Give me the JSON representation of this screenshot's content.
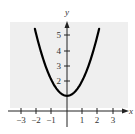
{
  "chart_data": {
    "type": "line",
    "title": "",
    "function": "y = x^2 + 1",
    "xlabel": "x",
    "ylabel": "y",
    "xlim": [
      -3,
      3
    ],
    "ylim": [
      0,
      5
    ],
    "grid": false,
    "background_color": "#efefef",
    "x_ticks": [
      -3,
      -2,
      -1,
      1,
      2,
      3
    ],
    "x_tick_labels": [
      "−3",
      "−2",
      "−1",
      "1",
      "2",
      "3"
    ],
    "y_ticks": [
      2,
      3,
      4,
      5
    ],
    "y_tick_labels": [
      "2",
      "3",
      "4",
      "5"
    ],
    "series": [
      {
        "name": "parabola",
        "x": [
          -2.1,
          -2,
          -1.5,
          -1,
          -0.5,
          0,
          0.5,
          1,
          1.5,
          2,
          2.1
        ],
        "y": [
          5.41,
          5,
          3.25,
          2,
          1.25,
          1,
          1.25,
          2,
          3.25,
          5,
          5.41
        ],
        "color": "#000000"
      }
    ]
  }
}
